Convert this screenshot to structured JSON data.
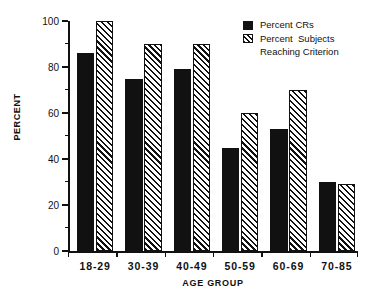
{
  "chart_data": {
    "type": "bar",
    "title": "",
    "subtitle": "",
    "xlabel": "AGE GROUP",
    "ylabel": "PERCENT",
    "categories": [
      "18-29",
      "30-39",
      "40-49",
      "50-59",
      "60-69",
      "70-85"
    ],
    "series": [
      {
        "name": "Percent CRs",
        "fill": "solid-black",
        "values": [
          86,
          75,
          79,
          45,
          53,
          30
        ]
      },
      {
        "name": "Percent  Subjects Reaching Criterion",
        "fill": "diagonal-hatch",
        "values": [
          100,
          90,
          90,
          60,
          70,
          29
        ]
      }
    ],
    "ylim": [
      0,
      100
    ],
    "yticks": [
      0,
      20,
      40,
      60,
      80,
      100
    ],
    "ytick_labels": [
      "0",
      "20",
      "40",
      "60",
      "80",
      "100"
    ],
    "yminor_step": 10,
    "grid": false,
    "legend_position": "top-right"
  },
  "legend": {
    "entries": [
      {
        "label": "Percent CRs",
        "label_cont": "",
        "swatch": "solid-black-square"
      },
      {
        "label": "Percent  Subjects",
        "label_cont": "Reaching Criterion",
        "swatch": "hatched-square"
      }
    ]
  },
  "axes": {
    "y_title": "PERCENT",
    "x_title": "AGE GROUP"
  },
  "colors": {
    "ink": "#111111",
    "background": "#ffffff",
    "series_1": "#111111",
    "series_2_outline": "#111111"
  }
}
